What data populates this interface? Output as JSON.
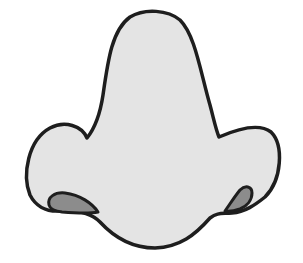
{
  "figure": {
    "colors": {
      "background": "#ffffff",
      "skin_fill": "#e4e4e4",
      "nostril_fill": "#8c8c8c",
      "outline": "#1e1e1e"
    }
  }
}
